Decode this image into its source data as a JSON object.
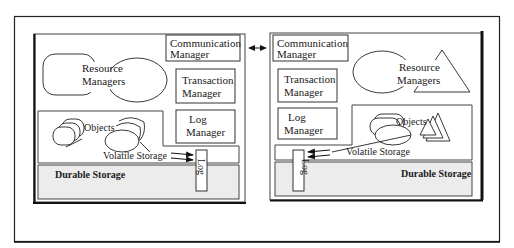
{
  "diagram": {
    "type": "two-node distributed transaction system architecture",
    "connection": {
      "label": "",
      "style": "bidirectional arrow between Communication Managers"
    },
    "left_node": {
      "communication_manager": "Communication",
      "communication_manager_2": "Manager",
      "resource_managers": "Resource",
      "resource_managers_2": "Managers",
      "transaction_manager": "Transaction",
      "transaction_manager_2": "Manager",
      "log_manager": "Log",
      "log_manager_2": "Manager",
      "objects": "Objects",
      "volatile_storage": "Volatile Storage",
      "durable_storage": "Durable Storage",
      "log": "Log"
    },
    "right_node": {
      "communication_manager": "Communication",
      "communication_manager_2": "Manager",
      "resource_managers": "Resource",
      "resource_managers_2": "Managers",
      "transaction_manager": "Transaction",
      "transaction_manager_2": "Manager",
      "log_manager": "Log",
      "log_manager_2": "Manager",
      "objects": "Objects",
      "volatile_storage": "Volatile Storage",
      "durable_storage": "Durable Storage",
      "log": "Log"
    },
    "colors": {
      "line": "#222222",
      "durable_fill": "#ececec",
      "background": "#ffffff"
    }
  }
}
